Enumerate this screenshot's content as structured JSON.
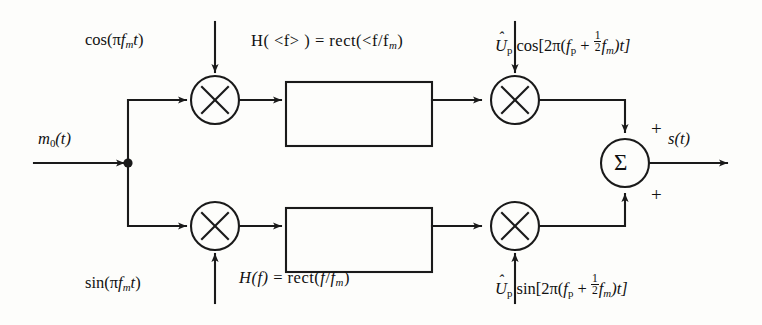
{
  "diagram": {
    "type": "block-diagram",
    "stroke_color": "#1a1a1a",
    "background_color": "#fdfdfb",
    "input": {
      "label_m0": "m",
      "label_m0_sub": "0",
      "label_m0_tail": "(t)"
    },
    "output": {
      "label_s": "s",
      "label_s_tail": "(t)"
    },
    "carriers": {
      "top_left": {
        "fn": "cos",
        "open": "(",
        "pi": "π",
        "f": "f",
        "fsub": "m",
        "t": "t",
        "close": ")"
      },
      "bottom_left": {
        "fn": "sin",
        "open": "(",
        "pi": "π",
        "f": "f",
        "fsub": "m",
        "t": "t",
        "close": ")"
      },
      "top_right": {
        "amp": "U",
        "amp_hat": "ˆ",
        "amp_sub": "p",
        "fn": "cos",
        "open": "[2π(",
        "f": "f",
        "fsub": "p",
        "plus": "+",
        "frac_num": "1",
        "frac_den": "2",
        "f2": "f",
        "f2sub": "m",
        "close": ")t]"
      },
      "bottom_right": {
        "amp": "U",
        "amp_hat": "ˆ",
        "amp_sub": "p",
        "fn": "sin",
        "open": "[2π(",
        "f": "f",
        "fsub": "p",
        "plus": "+",
        "frac_num": "1",
        "frac_den": "2",
        "f2": "f",
        "f2sub": "m",
        "close": ")t]"
      }
    },
    "filters": {
      "top": {
        "H": "H",
        "open": "( <f> )",
        "eq": "=",
        "rect": "rect(",
        "arg_a": "<f",
        "slash": "/",
        "arg_b": "f",
        "arg_sub": "m",
        "close": ")"
      },
      "bottom": {
        "H": "H",
        "open": "(f)",
        "eq": "=",
        "rect": "rect(",
        "arg_a": "f",
        "slash": "/",
        "arg_b": "f",
        "arg_sub": "m",
        "close": ")"
      }
    },
    "summer": {
      "glyph": "Σ",
      "sign_top": "+",
      "sign_bottom": "+"
    },
    "multipliers": {
      "glyph": "×",
      "count": 4
    },
    "nodes": {
      "junction": "split-dot"
    }
  }
}
